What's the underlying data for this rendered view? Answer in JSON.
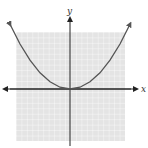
{
  "chart_data": {
    "type": "line",
    "title": "",
    "xlabel": "x",
    "ylabel": "y",
    "function": "y = x^2",
    "grid": true,
    "grid_cells": 20,
    "xlim": [
      -10,
      10
    ],
    "ylim": [
      -10,
      10
    ],
    "series": [
      {
        "name": "parabola",
        "x": [
          -3,
          -2.5,
          -2,
          -1.5,
          -1,
          -0.5,
          0,
          0.5,
          1,
          1.5,
          2,
          2.5,
          3
        ],
        "y": [
          9,
          6.25,
          4,
          2.25,
          1,
          0.25,
          0,
          0.25,
          1,
          2.25,
          4,
          6.25,
          9
        ]
      }
    ],
    "arrows": {
      "x_axis": "both",
      "y_axis": "up",
      "curve": "both-ends"
    }
  },
  "labels": {
    "x": "x",
    "y": "y"
  },
  "colors": {
    "grid_bg": "#e6e6e6",
    "grid_line": "#ffffff",
    "axis": "#222222",
    "curve": "#555555"
  }
}
